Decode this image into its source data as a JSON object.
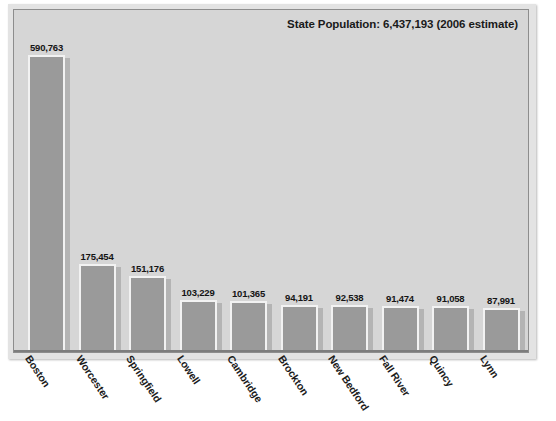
{
  "title": "State Population: 6,437,193 (2006 estimate)",
  "colors": {
    "background": "#ffffff",
    "panel": "#d6d6d6",
    "bar_fill": "#9a9a9a",
    "bar_outline": "#f2f2f2",
    "bar_shadow": "#b4b4b4",
    "text": "#1a1a1a",
    "frame": "#8d8d8d"
  },
  "chart_data": {
    "type": "bar",
    "title": "State Population: 6,437,193 (2006 estimate)",
    "subtitle": "",
    "xlabel": "",
    "ylabel": "",
    "grid": false,
    "legend": "none",
    "ylim": [
      0,
      640000
    ],
    "categories": [
      "Boston",
      "Worcester",
      "Springfield",
      "Lowell",
      "Cambridge",
      "Brockton",
      "New Bedford",
      "Fall River",
      "Quincy",
      "Lynn"
    ],
    "values": [
      590763,
      175454,
      151176,
      103229,
      101365,
      94191,
      92538,
      91474,
      91058,
      87991
    ],
    "value_labels": [
      "590,763",
      "175,454",
      "151,176",
      "103,229",
      "101,365",
      "94,191",
      "92,538",
      "91,474",
      "91,058",
      "87,991"
    ]
  }
}
